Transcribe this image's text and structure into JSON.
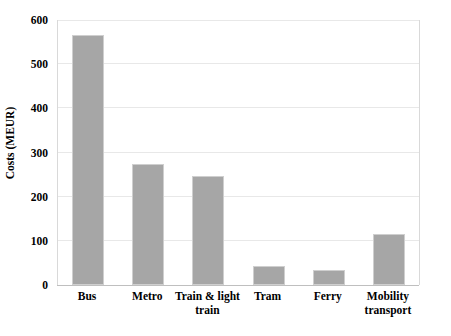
{
  "chart_data": {
    "type": "bar",
    "title": "",
    "xlabel": "",
    "ylabel": "Costs (MEUR)",
    "categories": [
      "Bus",
      "Metro",
      "Train & light train",
      "Tram",
      "Ferry",
      "Mobility transport"
    ],
    "category_lines": [
      [
        "Bus"
      ],
      [
        "Metro"
      ],
      [
        "Train & light",
        "train"
      ],
      [
        "Tram"
      ],
      [
        "Ferry"
      ],
      [
        "Mobility",
        "transport"
      ]
    ],
    "values": [
      565,
      273,
      247,
      42,
      34,
      116
    ],
    "ylim": [
      0,
      600
    ],
    "yticks": [
      0,
      100,
      200,
      300,
      400,
      500,
      600
    ],
    "ytick_labels": [
      "0",
      "100",
      "200",
      "300",
      "400",
      "500",
      "600"
    ],
    "grid": true,
    "grid_axis": "y",
    "legend": false,
    "legend_position": "none",
    "bar_color": "#a6a6a6",
    "bar_border_color": "#cfcfcf",
    "gridline_color": "#e8e8e8",
    "axis_color": "#bfbfbf",
    "background_color": "#ffffff",
    "text_color": "#000000"
  }
}
